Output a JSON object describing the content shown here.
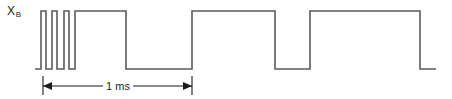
{
  "figure": {
    "background_color": "#ffffff",
    "trace_color": "#5a5a5a",
    "annotation_color": "#1b1b1b"
  },
  "signal": {
    "label_base": "X",
    "label_subscript": "B"
  },
  "dimension": {
    "label": "1 ms",
    "label_center_x": 118,
    "label_center_y": 86,
    "line_y": 86,
    "start_x": 43,
    "end_x": 192,
    "tick_top_y": 76,
    "tick_bottom_y": 95
  },
  "chart_data": {
    "type": "line",
    "title": "",
    "xlabel": "",
    "ylabel": "",
    "legend": [],
    "grid": false,
    "axis_ranges": {
      "x_pixels": [
        35,
        436
      ],
      "y_pixels": [
        11,
        69
      ]
    },
    "levels": {
      "high_y": 11,
      "low_y": 69
    },
    "series": [
      {
        "name": "X_B",
        "waveform_type": "digital-square",
        "start_x": 35,
        "end_x": 436,
        "initial_level": "low",
        "transitions_x": [
          41,
          46,
          52,
          57,
          64,
          69,
          75,
          80,
          126,
          192,
          227,
          275,
          310,
          358,
          420
        ],
        "segments": [
          {
            "level": "low",
            "x0": 35,
            "x1": 41
          },
          {
            "level": "high",
            "x0": 41,
            "x1": 46
          },
          {
            "level": "low",
            "x0": 46,
            "x1": 52
          },
          {
            "level": "high",
            "x0": 52,
            "x1": 57
          },
          {
            "level": "low",
            "x0": 57,
            "x1": 64
          },
          {
            "level": "high",
            "x0": 64,
            "x1": 69
          },
          {
            "level": "low",
            "x0": 69,
            "x1": 75
          },
          {
            "level": "high",
            "x0": 75,
            "x1": 80
          },
          {
            "level": "low",
            "x0": 80,
            "x1": 80
          },
          {
            "level": "high",
            "x0": 80,
            "x1": 126
          },
          {
            "level": "low",
            "x0": 126,
            "x1": 192
          },
          {
            "level": "high",
            "x0": 192,
            "x1": 275
          },
          {
            "level": "low",
            "x0": 275,
            "x1": 310
          },
          {
            "level": "high",
            "x0": 310,
            "x1": 420
          },
          {
            "level": "low",
            "x0": 420,
            "x1": 436
          }
        ]
      }
    ]
  }
}
